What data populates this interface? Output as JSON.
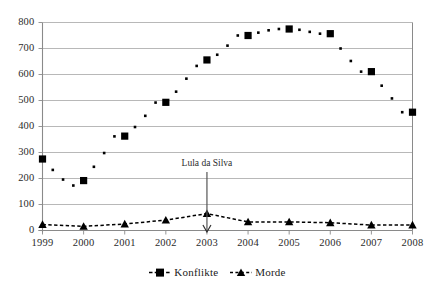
{
  "chart_data": {
    "type": "scatter",
    "title": "",
    "xlabel": "",
    "ylabel": "",
    "xlim": [
      1999,
      2008
    ],
    "ylim": [
      0,
      800
    ],
    "grid": "horizontal",
    "legend_position": "bottom",
    "y_ticks": [
      "0",
      "100",
      "200",
      "300",
      "400",
      "500",
      "600",
      "700",
      "800"
    ],
    "y_tick_values": [
      0,
      100,
      200,
      300,
      400,
      500,
      600,
      700,
      800
    ],
    "x_ticks": [
      "1999",
      "2000",
      "2001",
      "2002",
      "2003",
      "2004",
      "2005",
      "2006",
      "2007",
      "2008"
    ],
    "x_tick_values": [
      1999,
      2000,
      2001,
      2002,
      2003,
      2004,
      2005,
      2006,
      2007,
      2008
    ],
    "series": [
      {
        "name": "Konflikte",
        "marker": "square",
        "color": "#000000",
        "line": "none",
        "x": [
          1999,
          1999.25,
          1999.5,
          1999.75,
          2000,
          2000.25,
          2000.5,
          2000.75,
          2001,
          2001.25,
          2001.5,
          2001.75,
          2002,
          2002.25,
          2002.5,
          2002.75,
          2003,
          2003.25,
          2003.5,
          2003.75,
          2004,
          2004.25,
          2004.5,
          2004.75,
          2005,
          2005.25,
          2005.5,
          2005.75,
          2006,
          2006.25,
          2006.5,
          2006.75,
          2007,
          2007.25,
          2007.5,
          2007.75,
          2008
        ],
        "values": [
          275,
          233,
          196,
          173,
          192,
          245,
          298,
          362,
          363,
          398,
          441,
          492,
          493,
          534,
          584,
          633,
          656,
          676,
          711,
          750,
          750,
          761,
          770,
          775,
          775,
          772,
          764,
          757,
          757,
          700,
          652,
          611,
          611,
          557,
          508,
          455,
          455
        ],
        "year_values": [
          275,
          173,
          363,
          493,
          656,
          750,
          775,
          757,
          611,
          455
        ]
      },
      {
        "name": "Morde",
        "marker": "triangle",
        "color": "#000000",
        "line": "dashed",
        "x": [
          1999,
          2000,
          2001,
          2002,
          2003,
          2004,
          2005,
          2006,
          2007,
          2008
        ],
        "values": [
          23,
          16,
          25,
          40,
          65,
          33,
          33,
          30,
          21,
          21
        ]
      }
    ],
    "annotations": [
      {
        "text": "Lula da Silva",
        "x": 2003,
        "y": 65,
        "arrow": "down"
      }
    ]
  },
  "legend": {
    "items": [
      {
        "label": "Konflikte",
        "marker": "square-marker"
      },
      {
        "label": "Morde",
        "marker": "triangle-marker"
      }
    ]
  },
  "colors": {
    "marker": "#000000",
    "axis": "#808080",
    "grid": "#b0b0b0",
    "text": "#1a1a1a"
  }
}
